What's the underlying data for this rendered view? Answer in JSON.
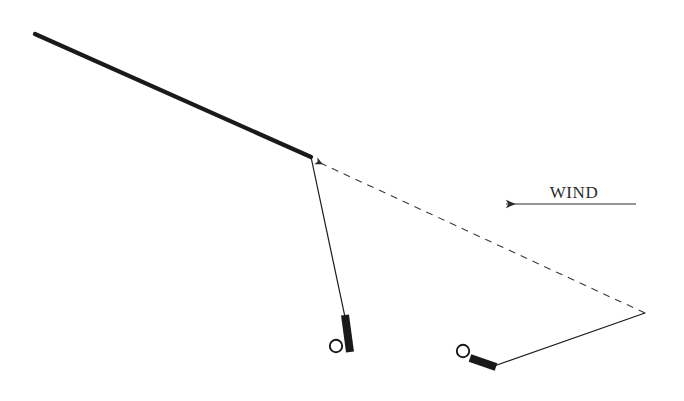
{
  "diagram": {
    "background_color": "#ffffff",
    "stroke_color": "#1a1a1a",
    "dash_color": "#3a3a3a",
    "wind": {
      "label": "WIND",
      "direction": "left",
      "arrow_color": "#2b2b2b",
      "line_start_x": 636,
      "line_end_x": 506,
      "line_y": 204,
      "label_x": 574,
      "label_y": 198
    },
    "upper_line": {
      "name": "thick-spar",
      "x1": 35,
      "y1": 34,
      "x2": 311,
      "y2": 157,
      "width": 4.2
    },
    "left_leader": {
      "name": "left-leader-line",
      "x1": 311,
      "y1": 157,
      "x2": 345,
      "y2": 317,
      "width": 1.2
    },
    "right_leader": {
      "name": "right-leader-line",
      "x1": 645,
      "y1": 313,
      "x2": 494,
      "y2": 366,
      "width": 1.2
    },
    "dashed_line": {
      "name": "dashed-reference-line",
      "x1": 645,
      "y1": 313,
      "x2": 316,
      "y2": 161,
      "width": 1.1,
      "dash": "7 6",
      "arrow_at": "upper-left"
    },
    "handles": [
      {
        "name": "left-handle",
        "grip_x1": 345,
        "grip_y1": 315,
        "grip_x2": 350,
        "grip_y2": 352,
        "grip_width": 8,
        "ring_cx": 336,
        "ring_cy": 346,
        "ring_r": 6.2,
        "ring_stroke": 1.9
      },
      {
        "name": "right-handle",
        "grip_x1": 470,
        "grip_y1": 358,
        "grip_x2": 496,
        "grip_y2": 367,
        "grip_width": 8,
        "ring_cx": 463,
        "ring_cy": 351,
        "ring_r": 6.2,
        "ring_stroke": 1.9
      }
    ]
  }
}
